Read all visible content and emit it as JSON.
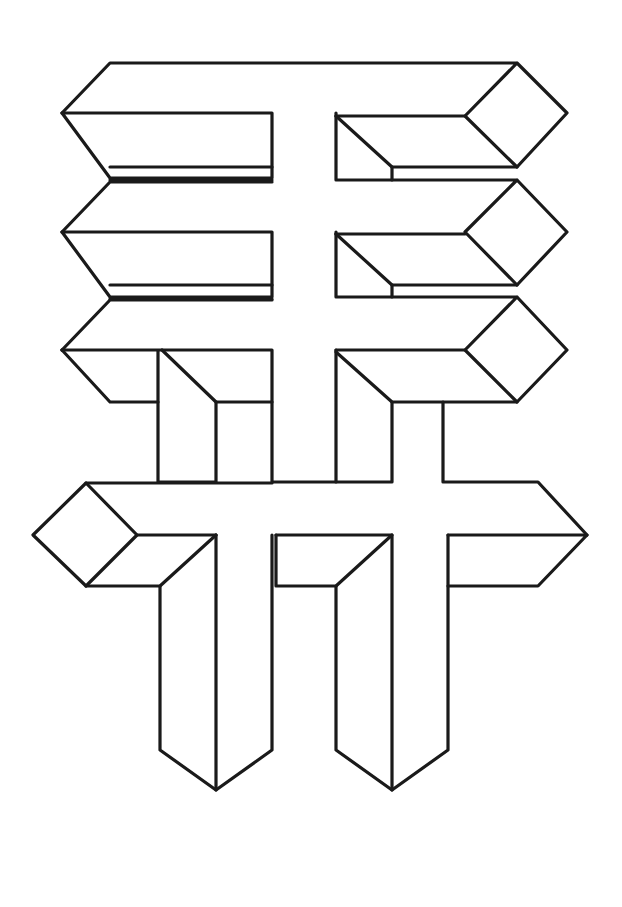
{
  "figure": {
    "title": "",
    "stroke_color": "#1a1a1a",
    "background": "#ffffff",
    "stroke_width": 3.2,
    "polylines": [
      [
        [
          62,
          113
        ],
        [
          110,
          63
        ],
        [
          517,
          63
        ],
        [
          567,
          113
        ],
        [
          517,
          167
        ],
        [
          465,
          116
        ],
        [
          517,
          63
        ]
      ],
      [
        [
          62,
          113
        ],
        [
          272,
          113
        ],
        [
          272,
          178
        ],
        [
          110,
          178
        ],
        [
          62,
          113
        ]
      ],
      [
        [
          110,
          167
        ],
        [
          272,
          167
        ]
      ],
      [
        [
          336,
          113
        ],
        [
          336,
          180
        ],
        [
          392,
          180
        ],
        [
          392,
          167
        ],
        [
          517,
          167
        ]
      ],
      [
        [
          336,
          116
        ],
        [
          392,
          167
        ]
      ],
      [
        [
          336,
          116
        ],
        [
          465,
          116
        ]
      ],
      [
        [
          110,
          180
        ],
        [
          272,
          180
        ]
      ],
      [
        [
          62,
          232
        ],
        [
          110,
          182
        ],
        [
          272,
          182
        ]
      ],
      [
        [
          62,
          232
        ],
        [
          272,
          232
        ],
        [
          272,
          297
        ],
        [
          110,
          297
        ],
        [
          62,
          232
        ]
      ],
      [
        [
          110,
          285
        ],
        [
          272,
          285
        ]
      ],
      [
        [
          392,
          180
        ],
        [
          517,
          180
        ],
        [
          567,
          232
        ],
        [
          517,
          285
        ],
        [
          465,
          232
        ],
        [
          517,
          180
        ]
      ],
      [
        [
          336,
          232
        ],
        [
          336,
          297
        ],
        [
          392,
          297
        ],
        [
          392,
          285
        ],
        [
          517,
          285
        ]
      ],
      [
        [
          336,
          234
        ],
        [
          392,
          285
        ]
      ],
      [
        [
          336,
          234
        ],
        [
          465,
          234
        ]
      ],
      [
        [
          110,
          299
        ],
        [
          272,
          299
        ]
      ],
      [
        [
          62,
          350
        ],
        [
          110,
          300
        ],
        [
          272,
          300
        ]
      ],
      [
        [
          62,
          350
        ],
        [
          272,
          350
        ],
        [
          272,
          402
        ],
        [
          216,
          402
        ],
        [
          216,
          482
        ],
        [
          158,
          482
        ],
        [
          158,
          350
        ]
      ],
      [
        [
          62,
          350
        ],
        [
          110,
          402
        ],
        [
          158,
          402
        ]
      ],
      [
        [
          162,
          350
        ],
        [
          216,
          402
        ]
      ],
      [
        [
          272,
          402
        ],
        [
          272,
          482
        ],
        [
          336,
          482
        ],
        [
          336,
          350
        ],
        [
          336,
          402
        ]
      ],
      [
        [
          392,
          297
        ],
        [
          517,
          297
        ],
        [
          567,
          350
        ],
        [
          517,
          402
        ],
        [
          465,
          350
        ],
        [
          517,
          297
        ]
      ],
      [
        [
          336,
          350
        ],
        [
          465,
          350
        ]
      ],
      [
        [
          336,
          352
        ],
        [
          392,
          402
        ],
        [
          517,
          402
        ]
      ],
      [
        [
          392,
          402
        ],
        [
          392,
          482
        ],
        [
          336,
          482
        ]
      ],
      [
        [
          443,
          402
        ],
        [
          443,
          482
        ],
        [
          538,
          482
        ],
        [
          587,
          535
        ]
      ],
      [
        [
          86,
          483
        ],
        [
          272,
          483
        ]
      ],
      [
        [
          86,
          483
        ],
        [
          33,
          535
        ],
        [
          86,
          586
        ],
        [
          137,
          535
        ],
        [
          86,
          483
        ]
      ],
      [
        [
          137,
          535
        ],
        [
          216,
          535
        ]
      ],
      [
        [
          86,
          586
        ],
        [
          160,
          586
        ],
        [
          216,
          535
        ]
      ],
      [
        [
          216,
          535
        ],
        [
          216,
          790
        ]
      ],
      [
        [
          160,
          586
        ],
        [
          160,
          750
        ],
        [
          216,
          790
        ],
        [
          272,
          750
        ],
        [
          272,
          535
        ]
      ],
      [
        [
          276,
          535
        ],
        [
          392,
          535
        ],
        [
          392,
          790
        ]
      ],
      [
        [
          276,
          535
        ],
        [
          276,
          586
        ],
        [
          336,
          586
        ],
        [
          392,
          535
        ]
      ],
      [
        [
          336,
          586
        ],
        [
          336,
          750
        ],
        [
          392,
          790
        ],
        [
          448,
          750
        ],
        [
          448,
          535
        ]
      ],
      [
        [
          448,
          535
        ],
        [
          587,
          535
        ],
        [
          538,
          586
        ],
        [
          448,
          586
        ]
      ]
    ]
  }
}
